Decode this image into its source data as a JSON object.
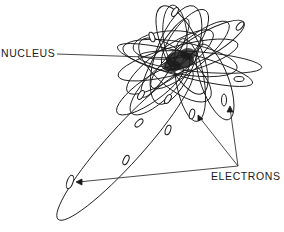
{
  "diagram": {
    "labels": {
      "nucleus": "NUCLEUS",
      "electrons": "ELECTRONS"
    },
    "colors": {
      "ink": "#1a1a1a",
      "background": "#ffffff"
    }
  }
}
